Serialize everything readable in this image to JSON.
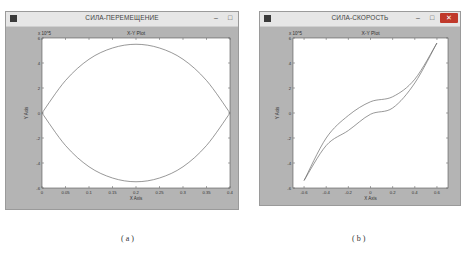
{
  "windows": [
    {
      "id": "a",
      "title": "СИЛА-ПЕРЕМЕЩЕНИЕ",
      "controls": {
        "minimize": "–",
        "maximize": "□",
        "close": "✕"
      },
      "caption": "( a )"
    },
    {
      "id": "b",
      "title": "СИЛА-СКОРОСТЬ",
      "controls": {
        "minimize": "–",
        "maximize": "□",
        "close": "✕"
      },
      "caption": "( b )"
    }
  ],
  "chart_data": [
    {
      "type": "line",
      "title": "X-Y Plot",
      "window_title": "СИЛА-ПЕРЕМЕЩЕНИЕ",
      "xlabel": "X Axis",
      "ylabel": "Y Axis",
      "y_multiplier": "x 10^5",
      "xlim": [
        0,
        0.4
      ],
      "ylim": [
        -6,
        6
      ],
      "xticks": [
        "0",
        "0.05",
        "0.1",
        "0.15",
        "0.2",
        "0.25",
        "0.3",
        "0.35",
        "0.4"
      ],
      "yticks": [
        "-6",
        "-4",
        "-2",
        "0",
        "2",
        "4",
        "6"
      ],
      "grid": false,
      "series": [
        {
          "name": "upper",
          "x": [
            0,
            0.05,
            0.1,
            0.15,
            0.2,
            0.25,
            0.3,
            0.35,
            0.4
          ],
          "y": [
            0,
            2.6,
            4.3,
            5.2,
            5.5,
            5.2,
            4.3,
            2.6,
            0
          ]
        },
        {
          "name": "lower",
          "x": [
            0,
            0.05,
            0.1,
            0.15,
            0.2,
            0.25,
            0.3,
            0.35,
            0.4
          ],
          "y": [
            0,
            -2.6,
            -4.3,
            -5.2,
            -5.5,
            -5.2,
            -4.3,
            -2.6,
            0
          ]
        }
      ]
    },
    {
      "type": "line",
      "title": "X-Y Plot",
      "window_title": "СИЛА-СКОРОСТЬ",
      "xlabel": "X Axis",
      "ylabel": "Y Axis",
      "y_multiplier": "x 10^5",
      "xlim": [
        -0.7,
        0.7
      ],
      "ylim": [
        -6,
        6
      ],
      "xticks": [
        "-0.6",
        "-0.4",
        "-0.2",
        "0",
        "0.2",
        "0.4",
        "0.6"
      ],
      "yticks": [
        "-6",
        "-4",
        "-2",
        "0",
        "2",
        "4",
        "6"
      ],
      "grid": false,
      "series": [
        {
          "name": "upper-branch",
          "x": [
            -0.6,
            -0.4,
            -0.2,
            0,
            0.2,
            0.4,
            0.6
          ],
          "y": [
            -5.4,
            -2.0,
            -0.2,
            0.9,
            1.3,
            2.7,
            5.6
          ]
        },
        {
          "name": "lower-branch",
          "x": [
            -0.6,
            -0.4,
            -0.2,
            0,
            0.2,
            0.4,
            0.6
          ],
          "y": [
            -5.4,
            -2.6,
            -1.4,
            -0.1,
            0.4,
            2.4,
            5.6
          ]
        }
      ]
    }
  ]
}
